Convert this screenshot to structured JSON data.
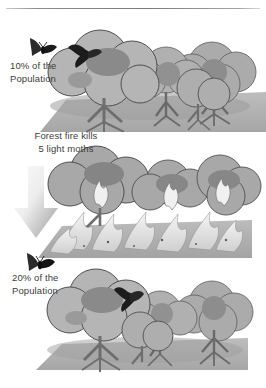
{
  "figure": {
    "name": "peppered-moth-natural-selection",
    "background_color": "#ffffff",
    "ink_color": "#3d3d3d"
  },
  "divider": {
    "name": "top-horizontal-rule"
  },
  "panels": [
    {
      "id": "healthy-forest",
      "order": 1,
      "description": "Healthy forest of leafy trees with one dark moth resting on the left canopy",
      "tree_count": 5,
      "moth_count": 1,
      "moth_type": "dark",
      "on_fire": false
    },
    {
      "id": "burning-forest",
      "order": 2,
      "description": "Same forest engulfed in flames, light moths destroyed by the fire",
      "tree_count": 5,
      "moth_count": 0,
      "moth_type": "none",
      "on_fire": true
    },
    {
      "id": "recovered-forest",
      "order": 3,
      "description": "Forest after the fire with a dark moth visible between the canopies",
      "tree_count": 5,
      "moth_count": 1,
      "moth_type": "dark",
      "on_fire": false
    }
  ],
  "labels": {
    "top_population": "10% of the\nPopulation",
    "fire_event": "Forest fire kills\n5 light moths",
    "bottom_population": "20% of the\nPopulation"
  },
  "markers": {
    "top_moth_icon": "dark-moth-icon",
    "bottom_moth_icon": "dark-moth-icon",
    "transition_arrow_icon": "down-arrow-icon",
    "transition_arrow_direction": "down"
  },
  "colors": {
    "foliage_light": "#b8b8b8",
    "foliage_mid": "#9e9e9e",
    "foliage_dark": "#868686",
    "foliage_shadow": "#767676",
    "trunk": "#a9a9a9",
    "trunk_outline": "#585858",
    "ground": "#b2b2b2",
    "ground_shadow": "#9c9c9c",
    "flame_light": "#e8e8e8",
    "flame_mid": "#cfcfcf",
    "moth_dark": "#1d1d1d",
    "arrow_light": "#f2f2f2",
    "arrow_dark": "#9a9a9a",
    "rule": "#7b7b7b"
  }
}
